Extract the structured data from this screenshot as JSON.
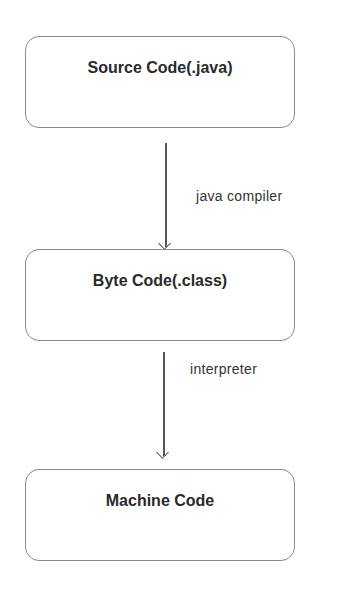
{
  "diagram": {
    "nodes": [
      {
        "id": "source",
        "label": "Source Code(.java)"
      },
      {
        "id": "bytecode",
        "label": "Byte Code(.class)"
      },
      {
        "id": "machine",
        "label": "Machine Code"
      }
    ],
    "edges": [
      {
        "from": "source",
        "to": "bytecode",
        "label": "java compiler"
      },
      {
        "from": "bytecode",
        "to": "machine",
        "label": "interpreter"
      }
    ]
  }
}
